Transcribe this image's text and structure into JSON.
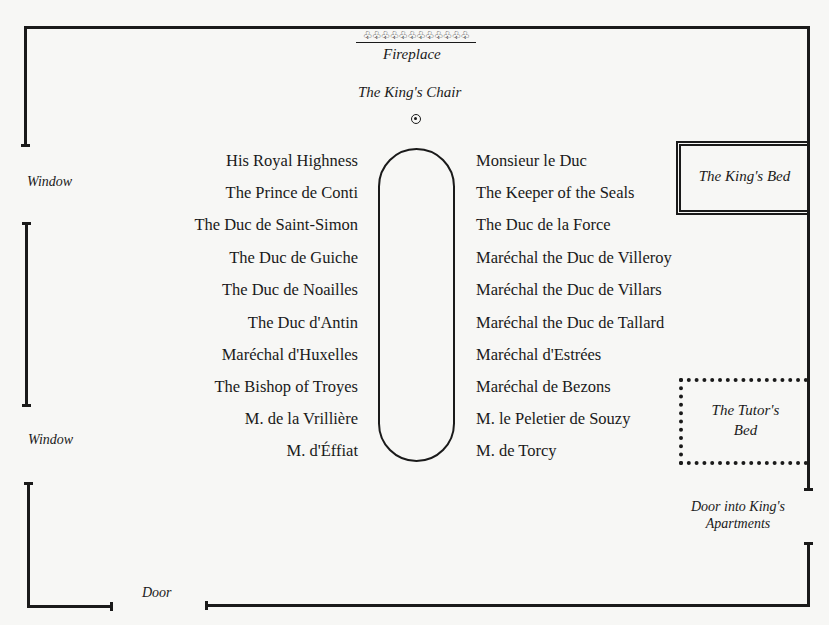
{
  "room": {
    "fireplace_ornament": "♧♧♧♧♧♧♧♧♧♧♧♧",
    "fireplace_label": "Fireplace",
    "kings_chair_label": "The King's Chair",
    "kings_bed_label": "The King's Bed",
    "tutors_bed_label_line1": "The Tutor's",
    "tutors_bed_label_line2": "Bed",
    "window_top_label": "Window",
    "window_bottom_label": "Window",
    "door_label": "Door",
    "door_kings_apartments_line1": "Door into King's",
    "door_kings_apartments_line2": "Apartments"
  },
  "seating": {
    "left": [
      "His Royal Highness",
      "The Prince de Conti",
      "The Duc de Saint-Simon",
      "The Duc de Guiche",
      "The Duc de Noailles",
      "The Duc d'Antin",
      "Maréchal d'Huxelles",
      "The Bishop of Troyes",
      "M. de la Vrillière",
      "M. d'Éffiat"
    ],
    "right": [
      "Monsieur le Duc",
      "The Keeper of the Seals",
      "The Duc de la Force",
      "Maréchal the Duc de Villeroy",
      "Maréchal the Duc de Villars",
      "Maréchal the Duc de Tallard",
      "Maréchal d'Estrées",
      "Maréchal de Bezons",
      "M. le Peletier de Souzy",
      "M. de Torcy"
    ]
  },
  "colors": {
    "ink": "#1a1a1a",
    "paper": "#f7f7f5"
  }
}
